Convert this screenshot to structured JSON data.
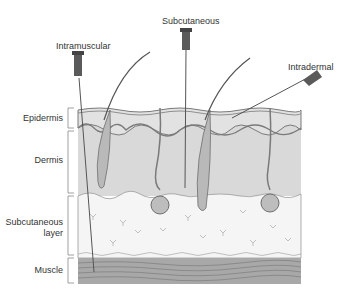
{
  "diagram": {
    "injection_labels": {
      "intramuscular": "Intramuscular",
      "subcutaneous": "Subcutaneous",
      "intradermal": "Intradermal"
    },
    "layer_labels": {
      "epidermis": "Epidermis",
      "dermis": "Dermis",
      "subcutaneous_line1": "Subcutaneous",
      "subcutaneous_line2": "layer",
      "muscle": "Muscle"
    },
    "colors": {
      "epidermis": "#d6d6d6",
      "dermis": "#d9d9d9",
      "subcutaneous": "#f4f4f4",
      "muscle": "#a8a8a8",
      "line": "#6e6e6e",
      "needle_hub": "#5a5a5a"
    }
  }
}
